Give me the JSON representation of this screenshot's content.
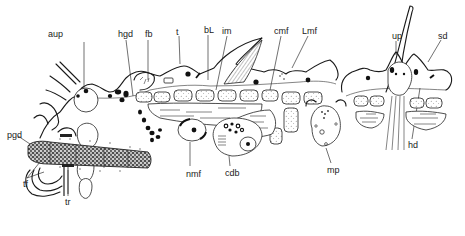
{
  "figure": {
    "type": "anatomical-section-drawing",
    "style": "black ink line drawing on white"
  },
  "labels": [
    {
      "id": "aup",
      "text": "aup",
      "x": 48,
      "y": 30
    },
    {
      "id": "hgd",
      "text": "hgd",
      "x": 118,
      "y": 30
    },
    {
      "id": "fb",
      "text": "fb",
      "x": 145,
      "y": 30
    },
    {
      "id": "t",
      "text": "t",
      "x": 176,
      "y": 28
    },
    {
      "id": "bL",
      "text": "bL",
      "x": 204,
      "y": 26
    },
    {
      "id": "im",
      "text": "im",
      "x": 222,
      "y": 27
    },
    {
      "id": "cmf",
      "text": "cmf",
      "x": 274,
      "y": 27
    },
    {
      "id": "Lmf",
      "text": "Lmf",
      "x": 302,
      "y": 27
    },
    {
      "id": "up",
      "text": "up",
      "x": 392,
      "y": 32
    },
    {
      "id": "sd",
      "text": "sd",
      "x": 438,
      "y": 32
    },
    {
      "id": "pgd",
      "text": "pgd",
      "x": 7,
      "y": 131
    },
    {
      "id": "nmf",
      "text": "nmf",
      "x": 186,
      "y": 170
    },
    {
      "id": "cdb",
      "text": "cdb",
      "x": 225,
      "y": 169
    },
    {
      "id": "mp",
      "text": "mp",
      "x": 327,
      "y": 166
    },
    {
      "id": "hd",
      "text": "hd",
      "x": 408,
      "y": 141
    },
    {
      "id": "tf",
      "text": "tf",
      "x": 23,
      "y": 180
    },
    {
      "id": "tr",
      "text": "tr",
      "x": 65,
      "y": 198
    }
  ]
}
